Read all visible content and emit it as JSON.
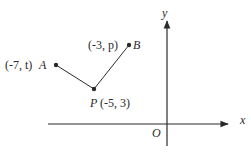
{
  "diagram": {
    "type": "coordinate-geometry",
    "axes": {
      "x_label": "x",
      "y_label": "y",
      "origin_label": "O"
    },
    "points": [
      {
        "name": "A",
        "coord_label": "(-7, t)",
        "x_expr": "-7",
        "y_expr": "t"
      },
      {
        "name": "P",
        "coord_label": "(-5, 3)",
        "x_expr": "-5",
        "y_expr": "3"
      },
      {
        "name": "B",
        "coord_label": "(-3, p)",
        "x_expr": "-3",
        "y_expr": "p"
      }
    ],
    "segments": [
      {
        "from": "A",
        "to": "P"
      },
      {
        "from": "P",
        "to": "B"
      }
    ],
    "colors": {
      "stroke": "#2a2a2a",
      "background": "#ffffff"
    }
  }
}
